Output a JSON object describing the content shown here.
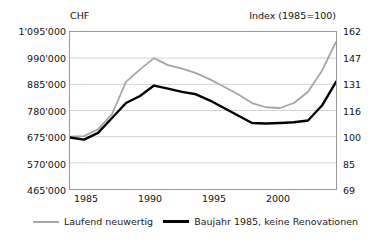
{
  "chart_data": {
    "type": "line",
    "title": "",
    "left_axis_label": "CHF",
    "right_axis_label": "Index (1985=100)",
    "xlabel": "",
    "grid": true,
    "legend_position": "bottom",
    "x": [
      1985,
      1986,
      1987,
      1988,
      1989,
      1990,
      1991,
      1992,
      1993,
      1994,
      1995,
      1996,
      1997,
      1998,
      1999,
      2000,
      2001,
      2002,
      2003,
      2004
    ],
    "xticks": [
      "1985",
      "1990",
      "1995",
      "2000"
    ],
    "xlim": [
      1985,
      2004
    ],
    "ylim": [
      465000,
      1095000
    ],
    "yticks_left": [
      "1'095'000",
      "990'000",
      "885'000",
      "780'000",
      "675'000",
      "570'000",
      "465'000"
    ],
    "yticks_left_values": [
      1095000,
      990000,
      885000,
      780000,
      675000,
      570000,
      465000
    ],
    "ylim_right": [
      69,
      162
    ],
    "yticks_right": [
      "162",
      "147",
      "131",
      "116",
      "100",
      "85",
      "69"
    ],
    "yticks_right_values": [
      162,
      147,
      131,
      116,
      100,
      85,
      69
    ],
    "series": [
      {
        "name": "Laufend neuwertig",
        "color": "#a6a6a6",
        "values": [
          675000,
          677000,
          705000,
          765000,
          895000,
          945000,
          990000,
          962000,
          948000,
          930000,
          905000,
          875000,
          845000,
          810000,
          793000,
          790000,
          810000,
          855000,
          940000,
          1055000
        ],
        "index_values": [
          100,
          100,
          104,
          113,
          132,
          140,
          147,
          143,
          140,
          137,
          134,
          129,
          125,
          120,
          117,
          117,
          120,
          126,
          139,
          156
        ]
      },
      {
        "name": "Baujahr 1985, keine Renovationen",
        "color": "#000000",
        "values": [
          672000,
          663000,
          690000,
          750000,
          810000,
          838000,
          880000,
          868000,
          855000,
          845000,
          820000,
          790000,
          760000,
          730000,
          728000,
          730000,
          733000,
          740000,
          800000,
          895000
        ],
        "index_values": [
          100,
          98,
          102,
          111,
          120,
          124,
          130,
          128,
          126,
          125,
          121,
          117,
          112,
          108,
          108,
          108,
          109,
          110,
          118,
          132
        ]
      }
    ]
  },
  "legend": {
    "entries": [
      {
        "label": "Laufend neuwertig"
      },
      {
        "label": "Baujahr 1985, keine Renovationen"
      }
    ]
  }
}
